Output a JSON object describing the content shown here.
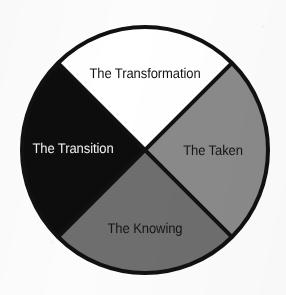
{
  "diagram": {
    "type": "quadrant-wheel",
    "shape": "circle",
    "title": "",
    "center": {
      "x": 145,
      "y": 150
    },
    "radius": 123,
    "outline_color": "#111111",
    "outline_width": 4,
    "separator_color": "#111111",
    "separator_width": 4,
    "background_color": "#fcfcfc",
    "rotation_degrees": 45,
    "segments": [
      {
        "id": "transformation",
        "position": "top",
        "label": "The Transformation",
        "fill_color": "#ffffff",
        "text_color": "#131313",
        "start_angle": 315,
        "end_angle": 45,
        "share_percent": 25
      },
      {
        "id": "taken",
        "position": "right",
        "label": "The Taken",
        "fill_color": "#8a8a8a",
        "text_color": "#151515",
        "start_angle": 45,
        "end_angle": 135,
        "share_percent": 25
      },
      {
        "id": "knowing",
        "position": "bottom",
        "label": "The Knowing",
        "fill_color": "#6e6e6e",
        "text_color": "#151515",
        "start_angle": 135,
        "end_angle": 225,
        "share_percent": 25
      },
      {
        "id": "transition",
        "position": "left",
        "label": "The Transition",
        "fill_color": "#0d0d0d",
        "text_color": "#f2f2f2",
        "start_angle": 225,
        "end_angle": 315,
        "share_percent": 25
      }
    ]
  }
}
